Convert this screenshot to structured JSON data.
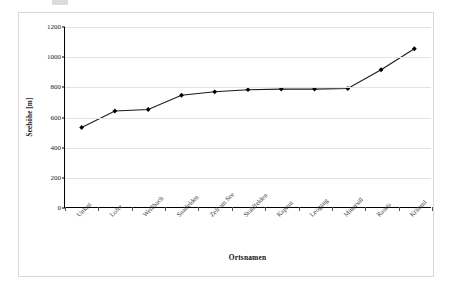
{
  "page": {
    "background_color": "#ffffff",
    "frame_border_color": "#d9d9d9"
  },
  "chart_data": {
    "type": "line",
    "title": "",
    "subtitle": "",
    "xlabel": "Ortsnamen",
    "ylabel": "Seehöhe [m]",
    "categories": [
      "Unken",
      "Lofer",
      "Weißbach",
      "Saalfelden",
      "Zell am See",
      "Stuhlfelden",
      "Kaprun",
      "Leogang",
      "Mittersill",
      "Rauris",
      "Krimml"
    ],
    "values": [
      530,
      640,
      650,
      745,
      768,
      782,
      786,
      786,
      790,
      915,
      1055
    ],
    "series": [
      {
        "name": "Seehöhe",
        "values": [
          530,
          640,
          650,
          745,
          768,
          782,
          786,
          786,
          790,
          915,
          1055
        ],
        "line_color": "#1a1a1a",
        "marker_color": "#000000",
        "marker_shape": "diamond"
      }
    ],
    "ylim": [
      0,
      1200
    ],
    "ytick_values": [
      0,
      200,
      400,
      600,
      800,
      1000,
      1200
    ],
    "ytick_labels": [
      "0",
      "200",
      "400",
      "600",
      "800",
      "1000",
      "1200"
    ],
    "grid": true,
    "grid_color": "#e3e3e3",
    "legend": false,
    "legend_position": "none",
    "xtick_rotation": -45,
    "axis_color": "#000000"
  }
}
